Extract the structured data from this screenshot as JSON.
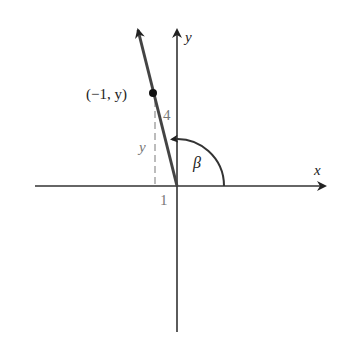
{
  "diagram": {
    "type": "angle-in-standard-position",
    "axes": {
      "x_label": "x",
      "y_label": "y"
    },
    "point_label": "(−1, y)",
    "hypotenuse_label": "4",
    "vertical_leg_label": "y",
    "horizontal_leg_label": "1",
    "angle_label": "β",
    "colors": {
      "axis": "#333333",
      "ray": "#444444",
      "dashed": "#999999",
      "label_gray": "#777777",
      "text": "#222222"
    }
  }
}
